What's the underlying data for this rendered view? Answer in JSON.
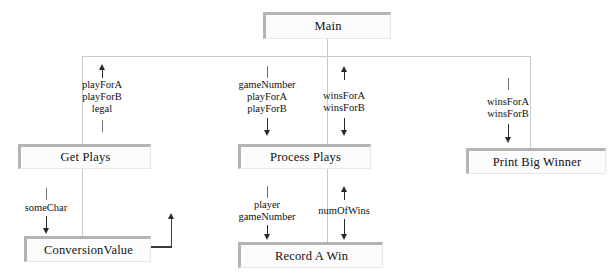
{
  "diagram": {
    "type": "structure-chart",
    "modules": [
      {
        "id": "main",
        "label": "Main",
        "x": 263,
        "y": 12,
        "w": 128,
        "h": 27
      },
      {
        "id": "get-plays",
        "label": "Get Plays",
        "x": 18,
        "y": 144,
        "w": 133,
        "h": 25
      },
      {
        "id": "process-plays",
        "label": "Process Plays",
        "x": 238,
        "y": 144,
        "w": 133,
        "h": 25
      },
      {
        "id": "print-big-winner",
        "label": "Print Big Winner",
        "x": 466,
        "y": 148,
        "w": 140,
        "h": 26
      },
      {
        "id": "conversion-value",
        "label": "ConversionValue",
        "x": 24,
        "y": 236,
        "w": 127,
        "h": 26
      },
      {
        "id": "record-a-win",
        "label": "Record A Win",
        "x": 238,
        "y": 242,
        "w": 145,
        "h": 26
      }
    ],
    "couples": [
      {
        "id": "main-to-get-plays",
        "from": "main",
        "to": "get-plays",
        "top_marker": "arrow-up",
        "bottom_marker": "line",
        "labels": [
          "playForA",
          "playForB",
          "legal"
        ]
      },
      {
        "id": "main-to-process-plays-down",
        "from": "main",
        "to": "process-plays",
        "top_marker": "line",
        "bottom_marker": "arrow-down",
        "labels": [
          "gameNumber",
          "playForA",
          "playForB"
        ]
      },
      {
        "id": "main-to-process-plays-up",
        "from": "process-plays",
        "to": "main",
        "top_marker": "arrow-up",
        "bottom_marker": "arrow-down",
        "labels": [
          "winsForA",
          "winsForB"
        ]
      },
      {
        "id": "main-to-print-big-winner",
        "from": "main",
        "to": "print-big-winner",
        "top_marker": "line",
        "bottom_marker": "arrow-down",
        "labels": [
          "winsForA",
          "winsForB"
        ]
      },
      {
        "id": "get-plays-to-conversion-value",
        "from": "get-plays",
        "to": "conversion-value",
        "top_marker": "line",
        "bottom_marker": "arrow-down",
        "labels": [
          "someChar"
        ]
      },
      {
        "id": "process-plays-to-record-a-win-down",
        "from": "process-plays",
        "to": "record-a-win",
        "top_marker": "line",
        "bottom_marker": "arrow-down",
        "labels": [
          "player",
          "gameNumber"
        ]
      },
      {
        "id": "process-plays-to-record-a-win-up",
        "from": "record-a-win",
        "to": "process-plays",
        "top_marker": "arrow-up",
        "bottom_marker": "arrow-down",
        "labels": [
          "numOfWins"
        ]
      }
    ],
    "return_paths": [
      {
        "id": "conversion-value-return",
        "from": "conversion-value",
        "shape": "L-right-up"
      }
    ],
    "colors": {
      "box_fill": "#fcfcfc",
      "box_border": "#b4b4b4",
      "connector": "#c9c9c9",
      "arrow": "#2a2a2a",
      "text": "#111111",
      "background": "#ffffff"
    }
  }
}
